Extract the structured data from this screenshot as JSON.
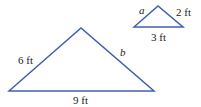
{
  "diagram": {
    "line_color": "#3f5fb5",
    "large_triangle": {
      "vertices": [
        [
          9,
          91
        ],
        [
          81,
          28
        ],
        [
          154,
          91
        ]
      ],
      "labels": {
        "left_side": "6 ft",
        "right_side": "b",
        "base": "9 ft"
      }
    },
    "small_triangle": {
      "vertices": [
        [
          134,
          27
        ],
        [
          158,
          6
        ],
        [
          183,
          27
        ]
      ],
      "labels": {
        "left_side": "a",
        "right_side": "2 ft",
        "base": "3 ft"
      }
    }
  }
}
